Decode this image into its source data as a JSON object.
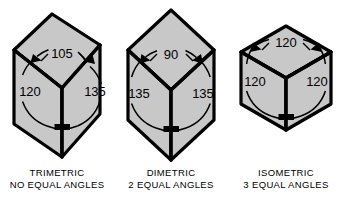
{
  "figure": {
    "background_color": "#ffffff",
    "face_fill_color": "#c8c8c8",
    "outline_color": "#000000",
    "dimension_line_color": "#000000",
    "text_color": "#000000"
  },
  "cubes": [
    {
      "id": "trimetric",
      "name": "TRIMETRIC",
      "subtitle": "NO EQUAL ANGLES",
      "angles": {
        "top": "105",
        "left": "120",
        "right": "135"
      }
    },
    {
      "id": "dimetric",
      "name": "DIMETRIC",
      "subtitle": "2 EQUAL ANGLES",
      "angles": {
        "top": "90",
        "left": "135",
        "right": "135"
      }
    },
    {
      "id": "isometric",
      "name": "ISOMETRIC",
      "subtitle": "3 EQUAL ANGLES",
      "angles": {
        "top": "120",
        "left": "120",
        "right": "120"
      }
    }
  ]
}
